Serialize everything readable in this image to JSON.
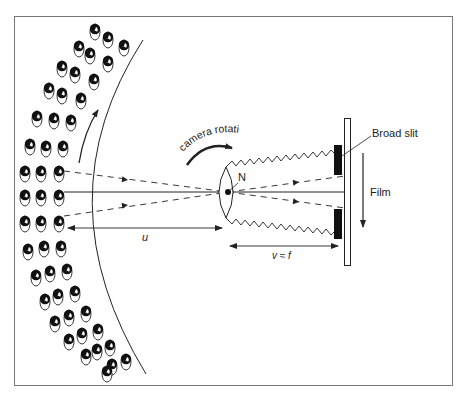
{
  "figure": {
    "labels": {
      "camera_rotation": "camera rotation",
      "nodal_point": "N",
      "broad_slit": "Broad slit",
      "film": "Film",
      "object_distance": "u",
      "image_distance": "v ≈ f"
    },
    "colors": {
      "stroke": "#222222",
      "frame": "#777777",
      "background": "#ffffff"
    },
    "crowd": {
      "description": "rows of people (heads with ellipse bodies) arranged along an arc",
      "rows_along_arc": 18
    }
  }
}
